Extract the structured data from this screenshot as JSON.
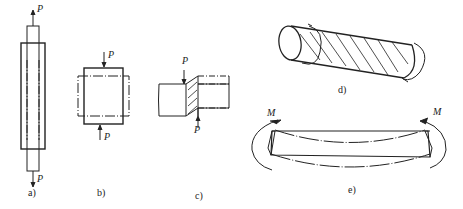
{
  "figures": [
    {
      "id": "a",
      "caption": "a)",
      "type": "tension",
      "loads": [
        "P",
        "P"
      ]
    },
    {
      "id": "b",
      "caption": "b)",
      "type": "compression",
      "loads": [
        "P",
        "P"
      ]
    },
    {
      "id": "c",
      "caption": "c)",
      "type": "shear",
      "loads": [
        "P",
        "P"
      ]
    },
    {
      "id": "d",
      "caption": "d)",
      "type": "torsion",
      "loads": []
    },
    {
      "id": "e",
      "caption": "e)",
      "type": "bending",
      "loads": [
        "M",
        "M"
      ]
    }
  ],
  "labels": {
    "load": "P",
    "moment": "M"
  }
}
